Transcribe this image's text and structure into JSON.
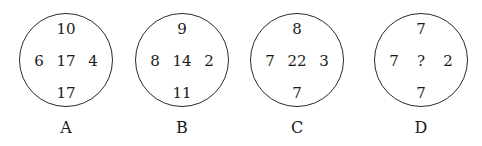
{
  "puzzle": {
    "circles": [
      {
        "label": "A",
        "top": "10",
        "left": "6",
        "center": "17",
        "right": "4",
        "bottom": "17"
      },
      {
        "label": "B",
        "top": "9",
        "left": "8",
        "center": "14",
        "right": "2",
        "bottom": "11"
      },
      {
        "label": "C",
        "top": "8",
        "left": "7",
        "center": "22",
        "right": "3",
        "bottom": "7"
      },
      {
        "label": "D",
        "top": "7",
        "left": "7",
        "center": "?",
        "right": "2",
        "bottom": "7"
      }
    ]
  }
}
